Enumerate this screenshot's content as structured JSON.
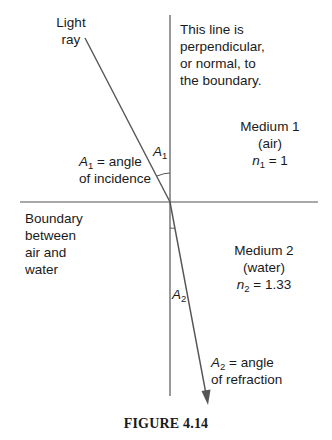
{
  "diagram": {
    "type": "refraction",
    "labels": {
      "light_ray_line1": "Light",
      "light_ray_line2": "ray",
      "normal_line1": "This line is",
      "normal_line2": "perpendicular,",
      "normal_line3": "or normal, to",
      "normal_line4": "the boundary.",
      "medium1_name": "Medium 1",
      "medium1_material": "(air)",
      "medium1_n_symbol": "n",
      "medium1_n_sub": "1",
      "medium1_n_value": " = 1",
      "a1_symbol": "A",
      "a1_sub": "1",
      "a1_desc_line1": " = angle",
      "a1_desc_line2": "of incidence",
      "a1_arc_symbol": "A",
      "a1_arc_sub": "1",
      "boundary_line1": "Boundary",
      "boundary_line2": "between",
      "boundary_line3": "air and",
      "boundary_line4": "water",
      "medium2_name": "Medium 2",
      "medium2_material": "(water)",
      "medium2_n_symbol": "n",
      "medium2_n_sub": "2",
      "medium2_n_value": " = 1.33",
      "a2_arc_symbol": "A",
      "a2_arc_sub": "2",
      "a2_symbol": "A",
      "a2_sub": "2",
      "a2_desc_line1": " = angle",
      "a2_desc_line2": "of refraction"
    },
    "colors": {
      "line": "#555555",
      "text": "#1a1a1a"
    },
    "geometry": {
      "intersection": [
        170,
        202
      ],
      "normal": {
        "x": 170,
        "y1": 15,
        "y2": 396
      },
      "boundary": {
        "y": 202,
        "x1": 20,
        "x2": 318
      },
      "incident_ray": {
        "start": [
          85,
          38
        ],
        "end": [
          170,
          202
        ]
      },
      "refracted_ray": {
        "start": [
          170,
          202
        ],
        "end": [
          208,
          404
        ]
      }
    }
  },
  "caption": "FIGURE 4.14"
}
